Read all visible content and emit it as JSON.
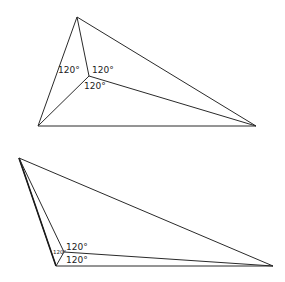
{
  "diagram": {
    "figures": [
      {
        "name": "triangle-interior-fermat-point",
        "vertices": {
          "A": [
            77,
            17
          ],
          "B": [
            38,
            126
          ],
          "C": [
            256,
            126
          ]
        },
        "fermat_point": [
          89,
          76
        ],
        "labels": [
          {
            "text": "120°",
            "x": 58,
            "y": 71
          },
          {
            "text": "120°",
            "x": 92,
            "y": 71
          },
          {
            "text": "120°",
            "x": 85,
            "y": 88
          }
        ]
      },
      {
        "name": "triangle-obtuse-fermat-point",
        "vertices": {
          "A": [
            19,
            158
          ],
          "B": [
            56,
            266
          ],
          "C": [
            273,
            266
          ]
        },
        "fermat_point": [
          64,
          252
        ],
        "labels": [
          {
            "text": "120°",
            "x": 66,
            "y": 249
          },
          {
            "text": "120°",
            "x": 66,
            "y": 262
          },
          {
            "text": "120°",
            "x": 54,
            "y": 253,
            "small": true
          }
        ]
      }
    ]
  }
}
